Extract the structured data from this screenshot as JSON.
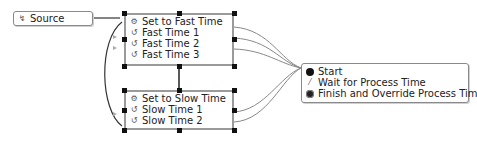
{
  "source": {
    "label": "Source",
    "icon": "source-icon"
  },
  "fast_group": {
    "header": {
      "label": "Set to Fast Time",
      "icon": "group-gear-icon"
    },
    "items": [
      {
        "label": "Fast Time 1",
        "icon": "loop-icon"
      },
      {
        "label": "Fast Time 2",
        "icon": "loop-icon"
      },
      {
        "label": "Fast Time 3",
        "icon": "loop-icon"
      }
    ]
  },
  "slow_group": {
    "header": {
      "label": "Set to Slow Time",
      "icon": "group-gear-icon"
    },
    "items": [
      {
        "label": "Slow Time 1",
        "icon": "loop-icon"
      },
      {
        "label": "Slow Time 2",
        "icon": "loop-icon"
      }
    ]
  },
  "process": {
    "items": [
      {
        "label": "Start",
        "icon": "start-dot-icon"
      },
      {
        "label": "Wait for Process Time",
        "icon": "wait-icon"
      },
      {
        "label": "Finish and Override Process Time",
        "icon": "finish-dot-icon"
      }
    ]
  },
  "colors": {
    "border": "#8a8a8a",
    "link": "#6e6e6e",
    "handle": "#111111"
  }
}
